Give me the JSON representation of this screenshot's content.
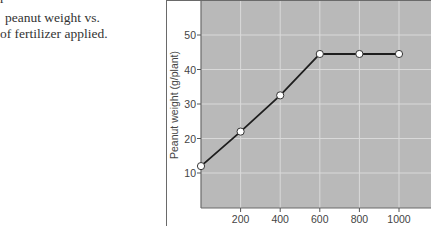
{
  "caption": {
    "cut_line": "r",
    "line1": "peanut weight vs.",
    "line2": "of fertilizer applied."
  },
  "colors": {
    "plot_bg": "#b9b9b9",
    "grid": "#d9d9d9",
    "line": "#1e1e1e",
    "marker_fill": "#ffffff",
    "frame": "#6a6a6a"
  },
  "chart_data": {
    "type": "line",
    "title": "",
    "xlabel": "",
    "ylabel": "Peanut weight (g/plant)",
    "x": [
      0,
      200,
      400,
      600,
      800,
      1000
    ],
    "series": [
      {
        "name": "Peanut weight",
        "values": [
          12,
          22,
          32.5,
          44.5,
          44.5,
          44.5
        ]
      }
    ],
    "x_ticks": [
      200,
      400,
      600,
      800,
      1000
    ],
    "y_ticks": [
      10,
      20,
      30,
      40,
      50
    ],
    "xlim": [
      0,
      1160
    ],
    "ylim": [
      0,
      60
    ],
    "grid": true,
    "markers": "open-circle",
    "legend": null
  },
  "axis": {
    "ylabel": "Peanut weight (g/plant)",
    "y_tick_labels": [
      "50",
      "40",
      "30",
      "20",
      "10"
    ],
    "x_tick_labels": [
      "200",
      "400",
      "600",
      "800",
      "1000"
    ]
  }
}
